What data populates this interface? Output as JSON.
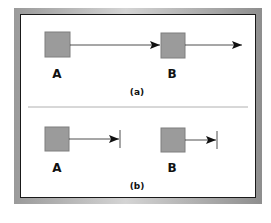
{
  "figure": {
    "panels": [
      {
        "caption": "(a)",
        "nodes": [
          {
            "label": "A",
            "fill": "#9b9b9b"
          },
          {
            "label": "B",
            "fill": "#9b9b9b"
          }
        ],
        "edges": [
          {
            "from": "A",
            "to": "B",
            "end": "arrow"
          },
          {
            "from": "B",
            "to": "right",
            "end": "arrow"
          }
        ]
      },
      {
        "caption": "(b)",
        "nodes": [
          {
            "label": "A",
            "fill": "#9b9b9b"
          },
          {
            "label": "B",
            "fill": "#9b9b9b"
          }
        ],
        "edges": [
          {
            "from": "A",
            "end": "arrow-with-bar"
          },
          {
            "from": "B",
            "end": "arrow-with-bar"
          }
        ]
      }
    ],
    "colors": {
      "node_fill": "#9b9b9b",
      "node_stroke": "#7a7a7a",
      "line": "#222222",
      "divider": "#b0b0b0"
    }
  }
}
